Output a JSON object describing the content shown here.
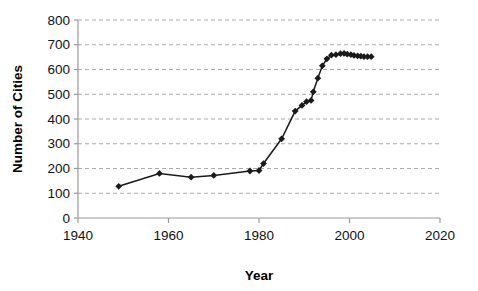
{
  "chart_data": {
    "type": "line",
    "title": "",
    "xlabel": "Year",
    "ylabel": "Number of Cities",
    "xlim": [
      1940,
      2020
    ],
    "ylim": [
      0,
      800
    ],
    "xticks": [
      1940,
      1960,
      1980,
      2000,
      2020
    ],
    "yticks": [
      0,
      100,
      200,
      300,
      400,
      500,
      600,
      700,
      800
    ],
    "xtick_labels": [
      "1940",
      "1960",
      "1980",
      "2000",
      "2020"
    ],
    "ytick_labels": [
      "0",
      "100",
      "200",
      "300",
      "400",
      "500",
      "600",
      "700",
      "800"
    ],
    "grid": "horizontal-dashed",
    "legend": "none",
    "marker": "diamond",
    "marker_color": "#1a1a1a",
    "line_color": "#1a1a1a",
    "axis_color": "#999999",
    "grid_color": "#aaaaaa",
    "series": [
      {
        "name": "Number of Cities",
        "x": [
          1949,
          1958,
          1965,
          1970,
          1978,
          1980,
          1981,
          1985,
          1988,
          1989.5,
          1990.5,
          1991.5,
          1992,
          1993,
          1994,
          1995,
          1996,
          1997,
          1998,
          1998.8,
          1999.5,
          2000.3,
          2001,
          2001.8,
          2002.5,
          2003.2,
          2004,
          2004.8
        ],
        "y": [
          128,
          180,
          165,
          172,
          190,
          192,
          220,
          320,
          432,
          455,
          470,
          475,
          510,
          565,
          615,
          643,
          658,
          660,
          664,
          665,
          662,
          660,
          657,
          655,
          654,
          652,
          652,
          652
        ]
      }
    ]
  },
  "axis": {
    "x_title": "Year",
    "y_title": "Number of Cities"
  }
}
